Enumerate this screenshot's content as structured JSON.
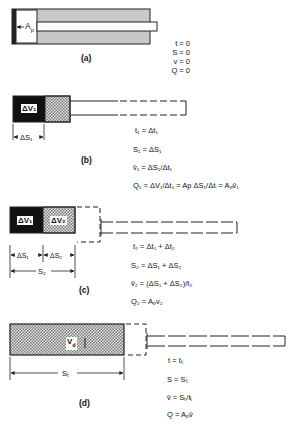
{
  "figure": {
    "panels": [
      {
        "id": "a",
        "caption": "(a)",
        "piston_label": "A",
        "piston_sub": "p",
        "equations": [
          "t = 0",
          "S = 0",
          "v = 0",
          "Q = 0"
        ]
      },
      {
        "id": "b",
        "caption": "(b)",
        "volume_label": "ΔV₁",
        "dim_label": "ΔS₁",
        "equations": [
          "t₁ = Δt₁",
          "S₁ = ΔS₁",
          "v̄₁ = ΔS₁/Δt₁",
          "Q₁ = ΔV₁/Δt₁ = Ap ΔS₁/Δtᵢ = Aₚv̄₁"
        ]
      },
      {
        "id": "c",
        "caption": "(c)",
        "volume_labels": [
          "ΔV₁",
          "ΔV₂"
        ],
        "dim_labels": [
          "ΔS₁",
          "ΔS₂",
          "S₂"
        ],
        "equations": [
          "t₂ = Δt₁ + Δt₂",
          "S₂ = ΔS₁ + ΔS₂",
          "v̄₂ = (ΔS₁ + ΔS₂)/t₂",
          "Q₂ = Aₚv₂"
        ]
      },
      {
        "id": "d",
        "caption": "(d)",
        "volume_label": "V_d",
        "volume_main": "V",
        "volume_sub": "d",
        "dim_label": "Sₜ",
        "equations": [
          "t = tₜ",
          "S = Sₜ",
          "v̄ = Sₜ/tₜ",
          "Q = Aₚv̄"
        ]
      }
    ],
    "colors": {
      "cylinder_fill": "#c8c8c8",
      "dark_fill": "#111111",
      "line": "#222222"
    }
  }
}
